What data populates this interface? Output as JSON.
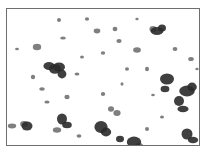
{
  "image": {
    "description": "Grayscale micrograph of dark particle agglomerates scattered on a white background, enclosed in a thin gray frame",
    "frame_color": "#6e6e6e",
    "particle_color": "#2a2a2a",
    "background_color": "#ffffff",
    "clusters": [
      {
        "x": 48,
        "y": 60,
        "r": 6
      },
      {
        "x": 52,
        "y": 58,
        "r": 5
      },
      {
        "x": 42,
        "y": 57,
        "r": 4
      },
      {
        "x": 55,
        "y": 65,
        "r": 4
      },
      {
        "x": 150,
        "y": 22,
        "r": 5
      },
      {
        "x": 155,
        "y": 19,
        "r": 4
      },
      {
        "x": 146,
        "y": 20,
        "r": 3
      },
      {
        "x": 160,
        "y": 70,
        "r": 5
      },
      {
        "x": 158,
        "y": 80,
        "r": 4
      },
      {
        "x": 180,
        "y": 82,
        "r": 6
      },
      {
        "x": 172,
        "y": 92,
        "r": 5
      },
      {
        "x": 185,
        "y": 78,
        "r": 4
      },
      {
        "x": 176,
        "y": 100,
        "r": 4
      },
      {
        "x": 20,
        "y": 117,
        "r": 5
      },
      {
        "x": 17,
        "y": 115,
        "r": 3
      },
      {
        "x": 55,
        "y": 110,
        "r": 5
      },
      {
        "x": 60,
        "y": 116,
        "r": 4
      },
      {
        "x": 50,
        "y": 121,
        "r": 3
      },
      {
        "x": 94,
        "y": 118,
        "r": 6
      },
      {
        "x": 99,
        "y": 123,
        "r": 4
      },
      {
        "x": 113,
        "y": 130,
        "r": 4
      },
      {
        "x": 127,
        "y": 133,
        "r": 6
      },
      {
        "x": 132,
        "y": 137,
        "r": 3
      },
      {
        "x": 180,
        "y": 125,
        "r": 5
      },
      {
        "x": 186,
        "y": 131,
        "r": 4
      },
      {
        "x": 104,
        "y": 100,
        "r": 3
      },
      {
        "x": 110,
        "y": 104,
        "r": 3
      },
      {
        "x": 30,
        "y": 38,
        "r": 3
      },
      {
        "x": 90,
        "y": 22,
        "r": 3
      },
      {
        "x": 130,
        "y": 41,
        "r": 3
      },
      {
        "x": 52,
        "y": 11,
        "r": 2
      },
      {
        "x": 108,
        "y": 20,
        "r": 2
      },
      {
        "x": 56,
        "y": 29,
        "r": 2
      },
      {
        "x": 96,
        "y": 44,
        "r": 2
      },
      {
        "x": 112,
        "y": 32,
        "r": 2
      },
      {
        "x": 140,
        "y": 60,
        "r": 2
      },
      {
        "x": 70,
        "y": 65,
        "r": 2
      },
      {
        "x": 35,
        "y": 80,
        "r": 2
      },
      {
        "x": 96,
        "y": 85,
        "r": 2
      },
      {
        "x": 60,
        "y": 88,
        "r": 2
      },
      {
        "x": 155,
        "y": 108,
        "r": 2
      },
      {
        "x": 72,
        "y": 127,
        "r": 2
      },
      {
        "x": 184,
        "y": 50,
        "r": 2
      },
      {
        "x": 26,
        "y": 68,
        "r": 2
      },
      {
        "x": 40,
        "y": 93,
        "r": 2
      },
      {
        "x": 120,
        "y": 60,
        "r": 2
      },
      {
        "x": 168,
        "y": 40,
        "r": 2
      },
      {
        "x": 80,
        "y": 10,
        "r": 1.5
      },
      {
        "x": 130,
        "y": 10,
        "r": 1.5
      },
      {
        "x": 10,
        "y": 40,
        "r": 1.5
      },
      {
        "x": 140,
        "y": 120,
        "r": 2
      },
      {
        "x": 88,
        "y": 140,
        "r": 1.5
      },
      {
        "x": 5,
        "y": 117,
        "r": 3
      },
      {
        "x": 190,
        "y": 60,
        "r": 1.5
      },
      {
        "x": 75,
        "y": 48,
        "r": 1.5
      },
      {
        "x": 115,
        "y": 75,
        "r": 1.5
      },
      {
        "x": 146,
        "y": 86,
        "r": 1.5
      }
    ]
  }
}
